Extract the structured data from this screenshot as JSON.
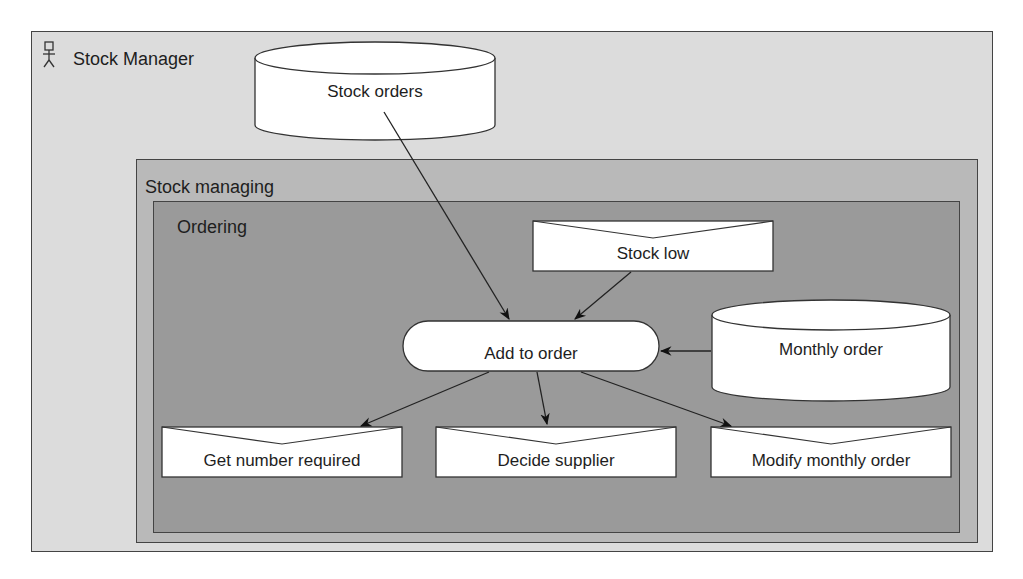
{
  "diagram": {
    "actor": {
      "label": "Stock Manager",
      "icon": "actor-stick-figure-icon"
    },
    "containers": [
      {
        "id": "stock_managing",
        "label": "Stock managing"
      },
      {
        "id": "ordering",
        "label": "Ordering"
      }
    ],
    "nodes": {
      "stock_orders": {
        "label": "Stock orders",
        "shape": "datastore-cylinder"
      },
      "stock_low": {
        "label": "Stock low",
        "shape": "envelope-event"
      },
      "add_to_order": {
        "label": "Add to order",
        "shape": "rounded-process"
      },
      "monthly_order": {
        "label": "Monthly order",
        "shape": "datastore-cylinder"
      },
      "get_number_required": {
        "label": "Get number required",
        "shape": "envelope-event"
      },
      "decide_supplier": {
        "label": "Decide supplier",
        "shape": "envelope-event"
      },
      "modify_monthly_order": {
        "label": "Modify monthly order",
        "shape": "envelope-event"
      }
    },
    "edges": [
      {
        "from": "Stock orders",
        "to": "Add to order"
      },
      {
        "from": "Stock low",
        "to": "Add to order"
      },
      {
        "from": "Monthly order",
        "to": "Add to order"
      },
      {
        "from": "Add to order",
        "to": "Get number required"
      },
      {
        "from": "Add to order",
        "to": "Decide supplier"
      },
      {
        "from": "Add to order",
        "to": "Modify monthly order"
      }
    ]
  }
}
